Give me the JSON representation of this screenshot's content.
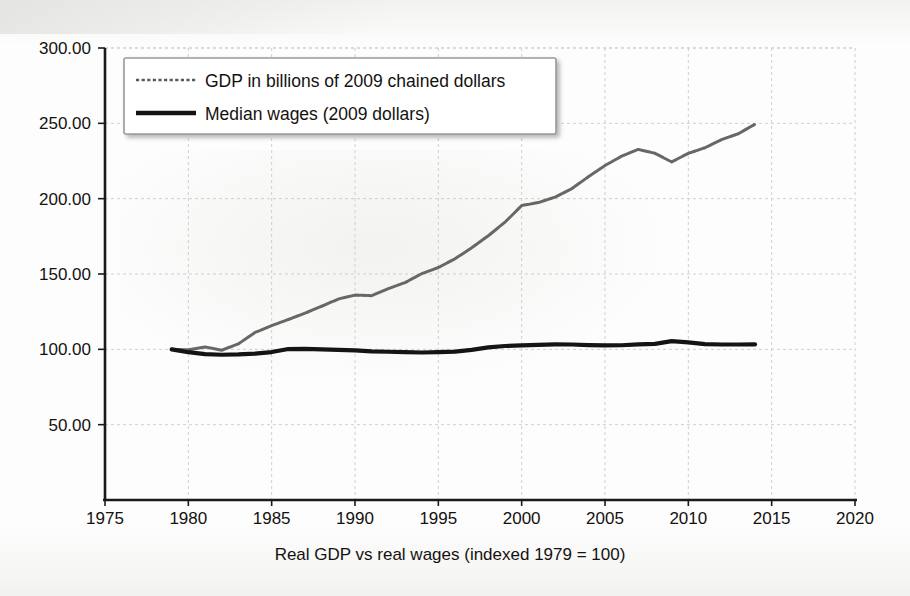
{
  "chart_data": {
    "type": "line",
    "title": "",
    "xlabel": "Real GDP vs real wages (indexed 1979 = 100)",
    "ylabel": "",
    "xlim": [
      1975,
      2020
    ],
    "ylim": [
      0,
      300
    ],
    "xticks": [
      1975,
      1980,
      1985,
      1990,
      1995,
      2000,
      2005,
      2010,
      2015,
      2020
    ],
    "xtick_labels": [
      "1975",
      "1980",
      "1985",
      "1990",
      "1995",
      "2000",
      "2005",
      "2010",
      "2015",
      "2020"
    ],
    "yticks": [
      50,
      100,
      150,
      200,
      250,
      300
    ],
    "ytick_labels": [
      "50.00",
      "100.00",
      "150.00",
      "200.00",
      "250.00",
      "300.00"
    ],
    "grid": true,
    "legend_position": "top-left",
    "x": [
      1979,
      1980,
      1981,
      1982,
      1983,
      1984,
      1985,
      1986,
      1987,
      1988,
      1989,
      1990,
      1991,
      1992,
      1993,
      1994,
      1995,
      1996,
      1997,
      1998,
      1999,
      2000,
      2001,
      2002,
      2003,
      2004,
      2005,
      2006,
      2007,
      2008,
      2009,
      2010,
      2011,
      2012,
      2013,
      2014
    ],
    "series": [
      {
        "name": "GDP in billions of 2009 chained dollars",
        "color": "#5a5a58",
        "style": "dashed-fine",
        "values": [
          100.0,
          99.7,
          101.6,
          99.4,
          103.6,
          111.2,
          115.7,
          119.8,
          124.0,
          128.6,
          133.4,
          136.0,
          135.6,
          140.3,
          144.3,
          150.2,
          154.3,
          160.1,
          167.4,
          175.4,
          184.4,
          195.4,
          197.4,
          201.0,
          206.6,
          214.5,
          222.0,
          228.2,
          232.7,
          230.1,
          224.4,
          230.1,
          233.8,
          239.2,
          243.1,
          249.4
        ]
      },
      {
        "name": "Median wages (2009 dollars)",
        "color": "#141414",
        "style": "solid-thick",
        "values": [
          100.0,
          98.1,
          96.8,
          96.4,
          96.6,
          97.2,
          98.2,
          100.2,
          100.3,
          100.0,
          99.6,
          99.3,
          98.6,
          98.4,
          98.1,
          97.9,
          98.2,
          98.5,
          99.6,
          101.3,
          102.2,
          102.6,
          103.0,
          103.3,
          103.2,
          102.8,
          102.6,
          102.7,
          103.3,
          103.6,
          105.4,
          104.6,
          103.5,
          103.2,
          103.2,
          103.3
        ]
      }
    ]
  },
  "legend": {
    "items": [
      {
        "label": "GDP in billions of 2009 chained dollars",
        "swatch": "dashed-gray-line"
      },
      {
        "label": "Median wages (2009 dollars)",
        "swatch": "solid-black-line"
      }
    ]
  },
  "axis": {
    "x_title": "Real GDP vs real wages (indexed 1979 = 100)",
    "x_labels": [
      "1975",
      "1980",
      "1985",
      "1990",
      "1995",
      "2000",
      "2005",
      "2010",
      "2015",
      "2020"
    ],
    "y_labels": [
      "300.00",
      "250.00",
      "200.00",
      "150.00",
      "100.00",
      "50.00"
    ]
  },
  "colors": {
    "gdp_line": "#5a5a58",
    "wages_line": "#141414",
    "axis": "#1a1a1a",
    "grid": "#cfcfcf",
    "background": "#fdfdfd",
    "legend_border": "#9a9a98"
  }
}
